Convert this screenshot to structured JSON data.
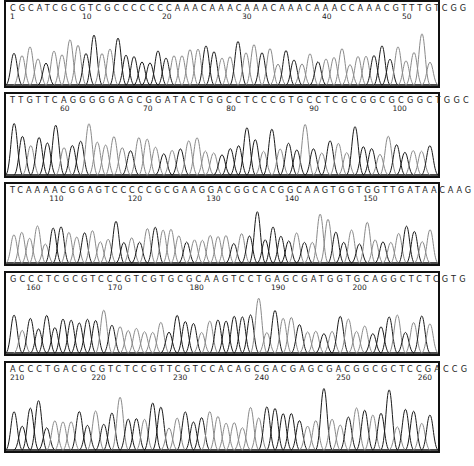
{
  "chart_data": {
    "type": "chromatogram",
    "title": "",
    "colors": {
      "primary": "#1a1a1a",
      "secondary": "#8a8a8a"
    },
    "panels": [
      {
        "sequence": "CGCATCGCGTCGCCCCCCCAAACAAACAAACAAACAAACCAAACGTTTGTCGG",
        "start": 1,
        "ticks": [
          {
            "label": "1",
            "pos": 1
          },
          {
            "label": "10",
            "pos": 10
          },
          {
            "label": "20",
            "pos": 20
          },
          {
            "label": "30",
            "pos": 30
          },
          {
            "label": "40",
            "pos": 40
          },
          {
            "label": "50",
            "pos": 50
          }
        ]
      },
      {
        "sequence": "TTGTTCAGGGGGAGCGGATACTGGCCTCCCGTGCCTCGCGGCGCGGCTGGC",
        "start": 54,
        "ticks": [
          {
            "label": "60",
            "pos": 60
          },
          {
            "label": "70",
            "pos": 70
          },
          {
            "label": "80",
            "pos": 80
          },
          {
            "label": "90",
            "pos": 90
          },
          {
            "label": "100",
            "pos": 100
          }
        ]
      },
      {
        "sequence": "TCAAAACGGAGTCCCCCGCGAAGGACGGCACGGCAAGTGGTGGTTGATAACAAG",
        "start": 105,
        "ticks": [
          {
            "label": "110",
            "pos": 110
          },
          {
            "label": "120",
            "pos": 120
          },
          {
            "label": "130",
            "pos": 130
          },
          {
            "label": "140",
            "pos": 140
          },
          {
            "label": "150",
            "pos": 150
          }
        ]
      },
      {
        "sequence": "GCCCTCGCGTCCCGTCGTGCGCAAGTCCTGAGCGATGGTGCAGGCTCTCGTG",
        "start": 158,
        "ticks": [
          {
            "label": "160",
            "pos": 160
          },
          {
            "label": "170",
            "pos": 170
          },
          {
            "label": "180",
            "pos": 180
          },
          {
            "label": "190",
            "pos": 190
          },
          {
            "label": "200",
            "pos": 200
          }
        ]
      },
      {
        "sequence": "ACCCTGACGCGTCTCCGTTCGTCCACAGCGACGAGCGACGGCGCTCCGACCG",
        "start": 210,
        "ticks": [
          {
            "label": "210",
            "pos": 210
          },
          {
            "label": "220",
            "pos": 220
          },
          {
            "label": "230",
            "pos": 230
          },
          {
            "label": "240",
            "pos": 240
          },
          {
            "label": "250",
            "pos": 250
          },
          {
            "label": "260",
            "pos": 260
          }
        ]
      }
    ],
    "xlabel": "",
    "ylabel": "",
    "grid": false,
    "legend": "none"
  }
}
